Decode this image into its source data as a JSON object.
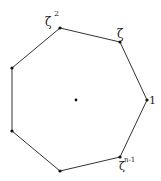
{
  "diagram": {
    "type": "regular-polygon",
    "sides": 7,
    "center": {
      "x": 76,
      "y": 100
    },
    "vertices": [
      {
        "x": 147,
        "y": 100
      },
      {
        "x": 120,
        "y": 42
      },
      {
        "x": 60,
        "y": 28
      },
      {
        "x": 12,
        "y": 68
      },
      {
        "x": 12,
        "y": 131
      },
      {
        "x": 60,
        "y": 171
      },
      {
        "x": 120,
        "y": 157
      }
    ],
    "labels": {
      "one": "1",
      "zeta": "ζ",
      "zeta_sq_base": "ζ",
      "zeta_sq_exp": "2",
      "zeta_n1_base": "ζ",
      "zeta_n1_exp": "n-1"
    },
    "stroke_color": "#333333"
  }
}
